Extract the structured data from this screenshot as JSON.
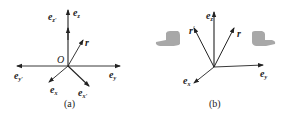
{
  "panels": [
    {
      "caption": "(a)",
      "origin_label": "O",
      "vectors": [
        {
          "base": "e",
          "sub": "z'",
          "label": "e_z'"
        },
        {
          "base": "e",
          "sub": "z",
          "label": "e_z"
        },
        {
          "base": "r",
          "sub": "",
          "label": "r"
        },
        {
          "base": "e",
          "sub": "y'",
          "label": "e_y'"
        },
        {
          "base": "e",
          "sub": "y",
          "label": "e_y"
        },
        {
          "base": "e",
          "sub": "x",
          "label": "e_x"
        },
        {
          "base": "e",
          "sub": "x'",
          "label": "e_x'"
        }
      ]
    },
    {
      "caption": "(b)",
      "vectors": [
        {
          "base": "e",
          "sub": "z",
          "label": "e_z"
        },
        {
          "base": "r",
          "sub": "'",
          "label": "r'"
        },
        {
          "base": "r",
          "sub": "",
          "label": "r"
        },
        {
          "base": "e",
          "sub": "y",
          "label": "e_y"
        },
        {
          "base": "e",
          "sub": "x",
          "label": "e_x"
        }
      ],
      "icons": [
        "left-hand-thumb-icon",
        "right-hand-thumb-icon"
      ]
    }
  ],
  "colors": {
    "line": "#222222",
    "hand": "#a8a8a8"
  }
}
